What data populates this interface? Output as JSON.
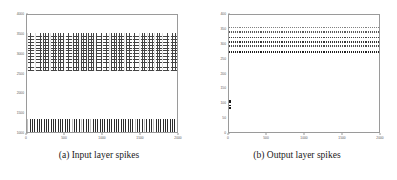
{
  "figure": {
    "panels": [
      {
        "id": "panel-a",
        "caption": "(a) Input layer spikes",
        "chart": {
          "type": "scatter",
          "title": "",
          "xlabel": "",
          "ylabel": "",
          "xlim": [
            0,
            2000
          ],
          "ylim": [
            1000,
            4000
          ],
          "xticks": [
            "0",
            "500",
            "1000",
            "1500",
            "2000"
          ],
          "yticks": [
            "1000",
            "1500",
            "2000",
            "2500",
            "3000",
            "3500",
            "4000"
          ],
          "grid": false,
          "legend": "none",
          "bands": [
            {
              "name": "upper-dense-raster",
              "y_range": [
                2800,
                3600
              ],
              "texture": "dotted-grid"
            },
            {
              "name": "lower-stripe-raster",
              "y_range": [
                1000,
                1300
              ],
              "texture": "vertical-stripes"
            }
          ]
        }
      },
      {
        "id": "panel-b",
        "caption": "(b) Output layer spikes",
        "chart": {
          "type": "scatter",
          "title": "",
          "xlabel": "",
          "ylabel": "",
          "xlim": [
            0,
            2000
          ],
          "ylim": [
            0,
            400
          ],
          "xticks": [
            "0",
            "500",
            "1000",
            "1500",
            "2000"
          ],
          "yticks": [
            "0",
            "50",
            "100",
            "150",
            "200",
            "250",
            "300",
            "350",
            "400"
          ],
          "grid": false,
          "legend": "none",
          "bands": [
            {
              "name": "spike-line-1",
              "y": 358,
              "thickness": 2,
              "density": 0.55
            },
            {
              "name": "spike-line-2",
              "y": 344,
              "thickness": 2,
              "density": 0.7
            },
            {
              "name": "spike-line-3",
              "y": 326,
              "thickness": 2,
              "density": 0.8
            },
            {
              "name": "spike-line-4",
              "y": 310,
              "thickness": 3,
              "density": 0.85
            },
            {
              "name": "spike-line-5",
              "y": 296,
              "thickness": 2,
              "density": 0.75
            },
            {
              "name": "spike-line-6",
              "y": 276,
              "thickness": 3,
              "density": 0.95
            }
          ],
          "clusters": [
            {
              "name": "low-index-cluster",
              "x_range": [
                0,
                40
              ],
              "y_range": [
                95,
                112
              ]
            }
          ]
        }
      }
    ]
  },
  "colors": {
    "ink": "#1a1a1a",
    "axis": "#9a9a9a",
    "tick_label": "#5a5a5a",
    "background": "#ffffff"
  }
}
